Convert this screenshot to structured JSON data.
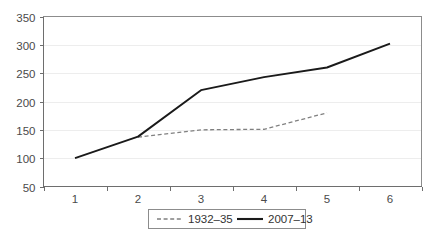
{
  "chart_data": {
    "type": "line",
    "title": "",
    "xlabel": "",
    "ylabel": "",
    "categories": [
      "1",
      "2",
      "3",
      "4",
      "5",
      "6"
    ],
    "x": [
      1,
      2,
      3,
      4,
      5,
      6
    ],
    "series": [
      {
        "name": "1932–35",
        "style": "dashed",
        "color": "#808080",
        "x": [
          2,
          3,
          4,
          5
        ],
        "values": [
          137,
          150,
          151,
          180
        ]
      },
      {
        "name": "2007–13",
        "style": "solid",
        "color": "#1a1a1a",
        "x": [
          1,
          2,
          3,
          4,
          5,
          6
        ],
        "values": [
          100,
          138,
          220,
          243,
          260,
          302
        ]
      }
    ],
    "ylim": [
      50,
      350
    ],
    "yticks": [
      50,
      100,
      150,
      200,
      250,
      300,
      350
    ],
    "ytick_labels": [
      "50",
      "100",
      "150",
      "200",
      "250",
      "300",
      "350"
    ],
    "xticks": [
      1,
      2,
      3,
      4,
      5,
      6
    ],
    "xtick_labels": [
      "1",
      "2",
      "3",
      "4",
      "5",
      "6"
    ],
    "grid": true,
    "grid_axis": "y",
    "legend_position": "bottom-center",
    "legend_entries": [
      "1932–35",
      "2007–13"
    ]
  },
  "colors": {
    "background": "#ffffff",
    "gridline": "#ededed",
    "axis": "#6e6e6e",
    "plot_border": "#8c8c8c",
    "series_dashed": "#808080",
    "series_solid": "#1a1a1a",
    "text": "#4a4a4a"
  }
}
